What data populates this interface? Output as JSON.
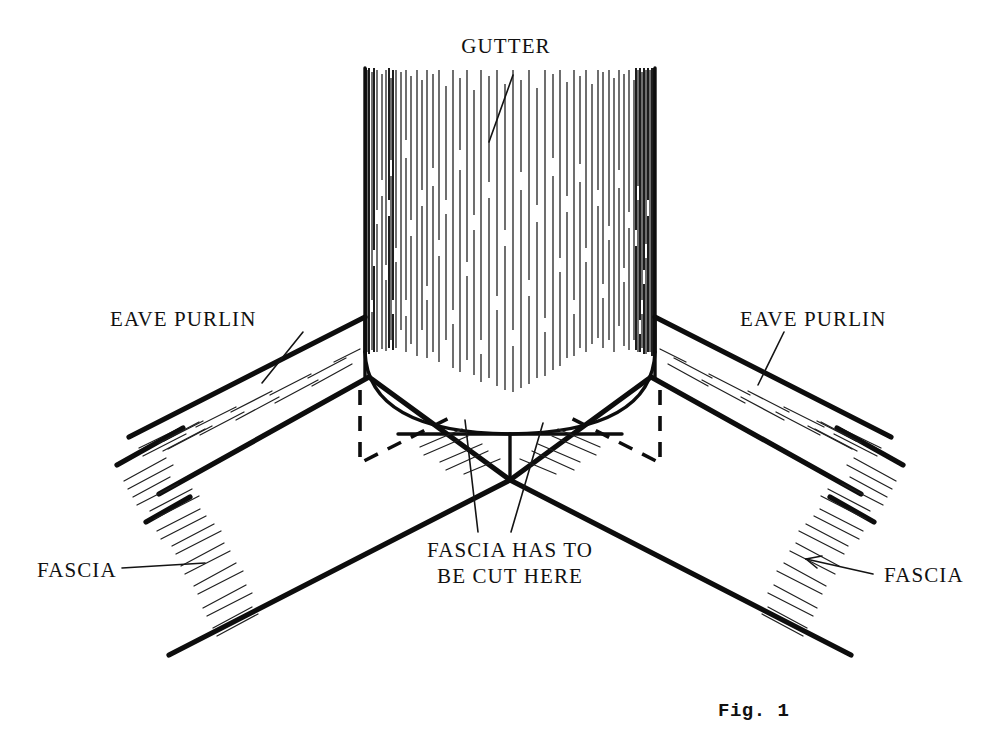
{
  "figure": {
    "caption": "Fig. 1",
    "background_color": "#ffffff",
    "ink_color": "#0d0d0d"
  },
  "labels": {
    "gutter": "GUTTER",
    "eave_purlin_left": "EAVE PURLIN",
    "eave_purlin_right": "EAVE PURLIN",
    "fascia_left": "FASCIA",
    "fascia_right": "FASCIA",
    "fascia_cut_line1": "FASCIA HAS TO",
    "fascia_cut_line2": "BE CUT HERE"
  },
  "parts": [
    {
      "name": "gutter",
      "label": "GUTTER",
      "kind": "vertical-cylinder",
      "rendering": "vertical-line-shading"
    },
    {
      "name": "eave-purlin-left",
      "label": "EAVE PURLIN",
      "kind": "sloping-band"
    },
    {
      "name": "eave-purlin-right",
      "label": "EAVE PURLIN",
      "kind": "sloping-band"
    },
    {
      "name": "fascia-left",
      "label": "FASCIA",
      "kind": "sloping-band"
    },
    {
      "name": "fascia-right",
      "label": "FASCIA",
      "kind": "sloping-band"
    },
    {
      "name": "hidden-edges",
      "label": "",
      "kind": "dashed-hidden-line"
    }
  ]
}
